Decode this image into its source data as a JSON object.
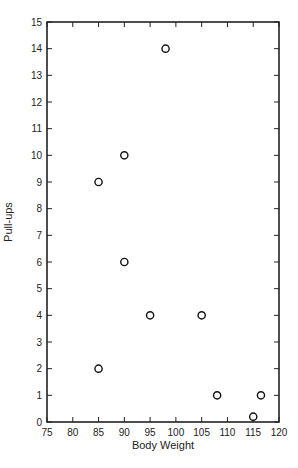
{
  "chart_data": {
    "type": "scatter",
    "title": "",
    "xlabel": "Body Weight",
    "ylabel": "Pull-ups",
    "xlim": [
      75,
      120
    ],
    "ylim": [
      0,
      15
    ],
    "xticks": [
      75,
      80,
      85,
      90,
      95,
      100,
      105,
      110,
      115,
      120
    ],
    "yticks": [
      0,
      1,
      2,
      3,
      4,
      5,
      6,
      7,
      8,
      9,
      10,
      11,
      12,
      13,
      14,
      15
    ],
    "grid": false,
    "marker": "open-circle",
    "points": [
      {
        "x": 98,
        "y": 14
      },
      {
        "x": 90,
        "y": 10
      },
      {
        "x": 85,
        "y": 9
      },
      {
        "x": 90,
        "y": 6
      },
      {
        "x": 95,
        "y": 4
      },
      {
        "x": 105,
        "y": 4
      },
      {
        "x": 85,
        "y": 2
      },
      {
        "x": 108,
        "y": 1
      },
      {
        "x": 116.5,
        "y": 1
      },
      {
        "x": 115,
        "y": 0.2
      }
    ]
  }
}
